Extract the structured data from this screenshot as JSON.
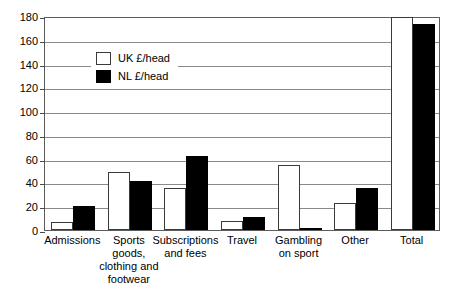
{
  "chart_data": {
    "type": "bar",
    "title": "",
    "subtitle": "",
    "xlabel": "",
    "ylabel": "",
    "ylim": [
      0,
      180
    ],
    "yticks": [
      0,
      20,
      40,
      60,
      80,
      100,
      120,
      140,
      160,
      180
    ],
    "ytick_labels": [
      "0",
      "20",
      "40",
      "60",
      "80",
      "100",
      "120",
      "140",
      "160",
      "180"
    ],
    "grid": "horizontal",
    "legend_position": "upper-left-inside",
    "categories": [
      "Admissions",
      "Sports\ngoods,\nclothing and\nfootwear",
      "Subscriptions\nand fees",
      "Travel",
      "Gambling\non sport",
      "Other",
      "Total"
    ],
    "series": [
      {
        "name": "UK £/head",
        "color": "#ffffff",
        "edge_color": "#3a3a3a",
        "values": [
          7,
          49,
          35,
          8,
          55,
          23,
          179
        ]
      },
      {
        "name": "NL £/head",
        "color": "#000000",
        "edge_color": "#000000",
        "values": [
          20,
          41,
          62,
          11,
          2,
          35,
          173
        ]
      }
    ]
  },
  "legend": {
    "entries": [
      {
        "label": "UK £/head",
        "swatch": "white-square-swatch"
      },
      {
        "label": "NL £/head",
        "swatch": "black-square-swatch"
      }
    ]
  }
}
